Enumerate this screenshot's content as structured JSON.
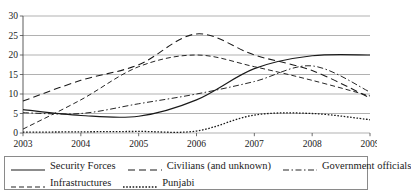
{
  "figure": {
    "title": "",
    "title_visible": false
  },
  "chart_data": {
    "type": "line",
    "title": "",
    "xlabel": "",
    "ylabel": "",
    "x": [
      2003,
      2004,
      2005,
      2006,
      2007,
      2008,
      2009
    ],
    "xtick_labels": [
      "2003",
      "2004",
      "2005",
      "2006",
      "2007",
      "2008",
      "2009"
    ],
    "ytick_labels": [
      "0",
      "5",
      "10",
      "15",
      "20",
      "25",
      "30"
    ],
    "yticks": [
      0,
      5,
      10,
      15,
      20,
      25,
      30
    ],
    "ylim": [
      0,
      30
    ],
    "xlim": [
      2003,
      2009
    ],
    "grid": true,
    "grid_axis": "y",
    "legend_position": "bottom",
    "series": [
      {
        "name": "Security Forces",
        "style": "solid",
        "color": "#1a1a1a",
        "values": [
          6.0,
          4.5,
          4.3,
          8.5,
          16.5,
          19.8,
          20.0
        ]
      },
      {
        "name": "Civilians (and unknown)",
        "style": "dashed",
        "color": "#1a1a1a",
        "values": [
          8.2,
          13.5,
          17.5,
          25.4,
          20.0,
          16.0,
          9.0
        ]
      },
      {
        "name": "Government officials",
        "style": "dashdot",
        "color": "#1a1a1a",
        "values": [
          5.2,
          5.0,
          7.5,
          10.0,
          13.2,
          17.2,
          10.5
        ]
      },
      {
        "name": "Infrastructures",
        "style": "longdash",
        "color": "#1a1a1a",
        "values": [
          1.0,
          8.5,
          17.0,
          20.0,
          17.0,
          13.5,
          9.5
        ]
      },
      {
        "name": "Punjabi",
        "style": "dotted",
        "color": "#1a1a1a",
        "values": [
          0.2,
          0.3,
          0.4,
          0.5,
          4.6,
          5.0,
          3.4
        ]
      }
    ]
  },
  "legend": {
    "row1": [
      {
        "label": "Security Forces",
        "style": "solid"
      },
      {
        "label": "Civilians (and unknown)",
        "style": "dashed"
      },
      {
        "label": "Government officials",
        "style": "dashdot"
      }
    ],
    "row2": [
      {
        "label": "Infrastructures",
        "style": "longdash"
      },
      {
        "label": "Punjabi",
        "style": "dotted"
      }
    ]
  }
}
